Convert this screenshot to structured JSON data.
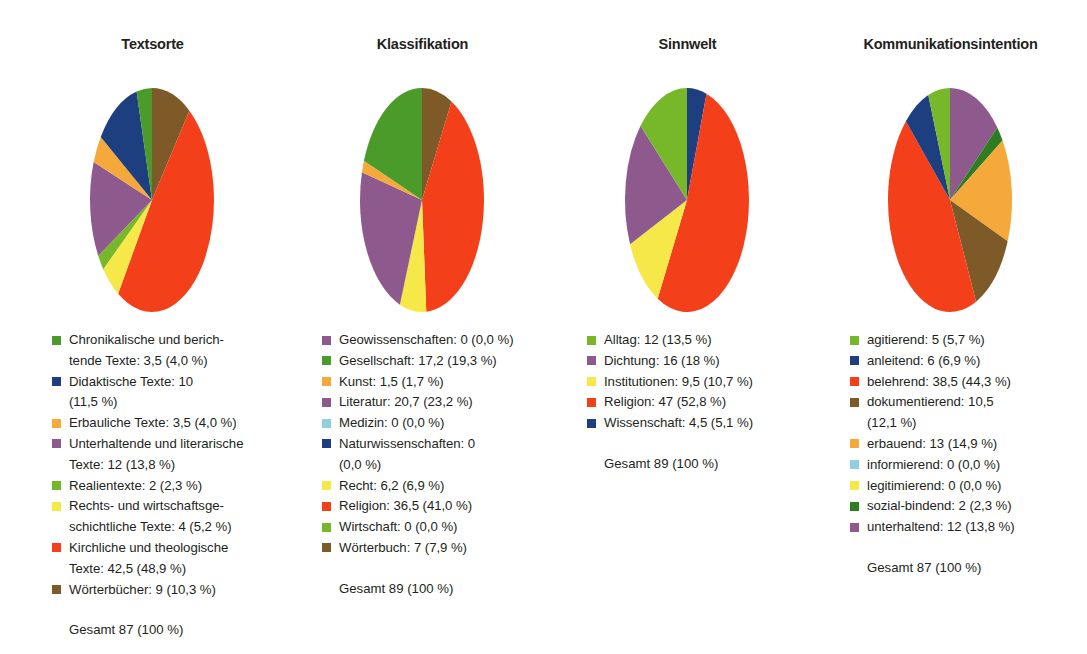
{
  "figure": {
    "background": "#ffffff",
    "text_color": "#231f20"
  },
  "palette": {
    "green": "#4a9b2a",
    "dark_green": "#2f7d23",
    "light_green": "#76b82a",
    "navy": "#1e3f7f",
    "orange": "#f5a93a",
    "purple": "#8e5a8e",
    "dusty_purple": "#8e5a8e",
    "yellow": "#f7e84a",
    "red": "#f4401a",
    "brown": "#7d5a27",
    "light_blue": "#8fcfe0"
  },
  "chart_data": [
    {
      "type": "pie",
      "title": "Textsorte",
      "total_label": "Gesamt 87 (100 %)",
      "total_value": 87,
      "legend_position": "below",
      "start_angle_deg": 0,
      "direction": "clockwise",
      "slices": [
        {
          "label": "Chronikalische und berichtende Texte",
          "legend": "Chronikalische und berich-\ntende Texte: 3,5 (4,0 %)",
          "value": 3.5,
          "percent": 4.0,
          "color": "#4a9b2a"
        },
        {
          "label": "Didaktische Texte",
          "legend": "Didaktische Texte: 10\n(11,5 %)",
          "value": 10,
          "percent": 11.5,
          "color": "#1e3f7f"
        },
        {
          "label": "Erbauliche Texte",
          "legend": "Erbauliche Texte: 3,5 (4,0 %)",
          "value": 3.5,
          "percent": 4.0,
          "color": "#f5a93a"
        },
        {
          "label": "Unterhaltende und literarische Texte",
          "legend": "Unterhaltende und literarische\nTexte: 12 (13,8 %)",
          "value": 12,
          "percent": 13.8,
          "color": "#8e5a8e"
        },
        {
          "label": "Realientexte",
          "legend": "Realientexte: 2 (2,3 %)",
          "value": 2,
          "percent": 2.3,
          "color": "#76b82a"
        },
        {
          "label": "Rechts- und wirtschaftsgeschichtliche Texte",
          "legend": "Rechts- und wirtschaftsge-\nschichtliche Texte: 4 (5,2 %)",
          "value": 4,
          "percent": 5.2,
          "color": "#f7e84a"
        },
        {
          "label": "Kirchliche und theologische Texte",
          "legend": "Kirchliche und theologische\nTexte: 42,5 (48,9 %)",
          "value": 42.5,
          "percent": 48.9,
          "color": "#f4401a"
        },
        {
          "label": "Wörterbücher",
          "legend": "Wörterbücher: 9 (10,3 %)",
          "value": 9,
          "percent": 10.3,
          "color": "#7d5a27"
        }
      ],
      "draw_order": [
        {
          "percent": 10.3,
          "color": "#7d5a27"
        },
        {
          "percent": 48.9,
          "color": "#f4401a"
        },
        {
          "percent": 5.2,
          "color": "#f7e84a"
        },
        {
          "percent": 2.3,
          "color": "#76b82a"
        },
        {
          "percent": 13.8,
          "color": "#8e5a8e"
        },
        {
          "percent": 4.0,
          "color": "#f5a93a"
        },
        {
          "percent": 11.5,
          "color": "#1e3f7f"
        },
        {
          "percent": 4.0,
          "color": "#4a9b2a"
        }
      ]
    },
    {
      "type": "pie",
      "title": "Klassifikation",
      "total_label": "Gesamt 89 (100 %)",
      "total_value": 89,
      "legend_position": "below",
      "start_angle_deg": 0,
      "direction": "clockwise",
      "slices": [
        {
          "label": "Geowissenschaften",
          "legend": "Geowissenschaften: 0 (0,0 %)",
          "value": 0,
          "percent": 0.0,
          "color": "#8e5a8e"
        },
        {
          "label": "Gesellschaft",
          "legend": "Gesellschaft: 17,2 (19,3 %)",
          "value": 17.2,
          "percent": 19.3,
          "color": "#4a9b2a"
        },
        {
          "label": "Kunst",
          "legend": "Kunst: 1,5 (1,7 %)",
          "value": 1.5,
          "percent": 1.7,
          "color": "#f5a93a"
        },
        {
          "label": "Literatur",
          "legend": "Literatur: 20,7 (23,2 %)",
          "value": 20.7,
          "percent": 23.2,
          "color": "#8e5a8e"
        },
        {
          "label": "Medizin",
          "legend": "Medizin: 0 (0,0 %)",
          "value": 0,
          "percent": 0.0,
          "color": "#8fcfe0"
        },
        {
          "label": "Naturwissenschaften",
          "legend": "Naturwissenschaften: 0\n(0,0 %)",
          "value": 0,
          "percent": 0.0,
          "color": "#1e3f7f"
        },
        {
          "label": "Recht",
          "legend": "Recht: 6,2 (6,9 %)",
          "value": 6.2,
          "percent": 6.9,
          "color": "#f7e84a"
        },
        {
          "label": "Religion",
          "legend": "Religion: 36,5 (41,0 %)",
          "value": 36.5,
          "percent": 41.0,
          "color": "#f4401a"
        },
        {
          "label": "Wirtschaft",
          "legend": "Wirtschaft: 0 (0,0 %)",
          "value": 0,
          "percent": 0.0,
          "color": "#76b82a"
        },
        {
          "label": "Wörterbuch",
          "legend": "Wörterbuch: 7 (7,9 %)",
          "value": 7,
          "percent": 7.9,
          "color": "#7d5a27"
        }
      ],
      "draw_order": [
        {
          "percent": 7.9,
          "color": "#7d5a27"
        },
        {
          "percent": 41.0,
          "color": "#f4401a"
        },
        {
          "percent": 6.9,
          "color": "#f7e84a"
        },
        {
          "percent": 23.2,
          "color": "#8e5a8e"
        },
        {
          "percent": 1.7,
          "color": "#f5a93a"
        },
        {
          "percent": 19.3,
          "color": "#4a9b2a"
        }
      ]
    },
    {
      "type": "pie",
      "title": "Sinnwelt",
      "total_label": "Gesamt 89 (100 %)",
      "total_value": 89,
      "legend_position": "below",
      "start_angle_deg": 0,
      "direction": "clockwise",
      "slices": [
        {
          "label": "Alltag",
          "legend": "Alltag: 12 (13,5 %)",
          "value": 12,
          "percent": 13.5,
          "color": "#76b82a"
        },
        {
          "label": "Dichtung",
          "legend": "Dichtung: 16 (18 %)",
          "value": 16,
          "percent": 18.0,
          "color": "#8e5a8e"
        },
        {
          "label": "Institutionen",
          "legend": "Institutionen: 9,5 (10,7 %)",
          "value": 9.5,
          "percent": 10.7,
          "color": "#f7e84a"
        },
        {
          "label": "Religion",
          "legend": "Religion: 47 (52,8 %)",
          "value": 47,
          "percent": 52.8,
          "color": "#f4401a"
        },
        {
          "label": "Wissenschaft",
          "legend": "Wissenschaft: 4,5 (5,1 %)",
          "value": 4.5,
          "percent": 5.1,
          "color": "#1e3f7f"
        }
      ],
      "draw_order": [
        {
          "percent": 5.1,
          "color": "#1e3f7f"
        },
        {
          "percent": 52.8,
          "color": "#f4401a"
        },
        {
          "percent": 10.7,
          "color": "#f7e84a"
        },
        {
          "percent": 18.0,
          "color": "#8e5a8e"
        },
        {
          "percent": 13.5,
          "color": "#76b82a"
        }
      ]
    },
    {
      "type": "pie",
      "title": "Kommunikationsintention",
      "total_label": "Gesamt 87 (100 %)",
      "total_value": 87,
      "legend_position": "below",
      "start_angle_deg": 0,
      "direction": "clockwise",
      "slices": [
        {
          "label": "agitierend",
          "legend": "agitierend: 5 (5,7 %)",
          "value": 5,
          "percent": 5.7,
          "color": "#76b82a"
        },
        {
          "label": "anleitend",
          "legend": "anleitend: 6 (6,9 %)",
          "value": 6,
          "percent": 6.9,
          "color": "#1e3f7f"
        },
        {
          "label": "belehrend",
          "legend": "belehrend: 38,5 (44,3 %)",
          "value": 38.5,
          "percent": 44.3,
          "color": "#f4401a"
        },
        {
          "label": "dokumentierend",
          "legend": "dokumentierend: 10,5\n(12,1 %)",
          "value": 10.5,
          "percent": 12.1,
          "color": "#7d5a27"
        },
        {
          "label": "erbauend",
          "legend": "erbauend: 13 (14,9 %)",
          "value": 13,
          "percent": 14.9,
          "color": "#f5a93a"
        },
        {
          "label": "informierend",
          "legend": "informierend: 0 (0,0 %)",
          "value": 0,
          "percent": 0.0,
          "color": "#8fcfe0"
        },
        {
          "label": "legitimierend",
          "legend": "legitimierend: 0 (0,0 %)",
          "value": 0,
          "percent": 0.0,
          "color": "#f7e84a"
        },
        {
          "label": "sozial-bindend",
          "legend": "sozial-bindend: 2 (2,3 %)",
          "value": 2,
          "percent": 2.3,
          "color": "#2f7d23"
        },
        {
          "label": "unterhaltend",
          "legend": "unterhaltend: 12 (13,8 %)",
          "value": 12,
          "percent": 13.8,
          "color": "#8e5a8e"
        }
      ],
      "draw_order": [
        {
          "percent": 13.8,
          "color": "#8e5a8e"
        },
        {
          "percent": 2.3,
          "color": "#2f7d23"
        },
        {
          "percent": 14.9,
          "color": "#f5a93a"
        },
        {
          "percent": 12.1,
          "color": "#7d5a27"
        },
        {
          "percent": 44.3,
          "color": "#f4401a"
        },
        {
          "percent": 6.9,
          "color": "#1e3f7f"
        },
        {
          "percent": 5.7,
          "color": "#76b82a"
        }
      ]
    }
  ]
}
